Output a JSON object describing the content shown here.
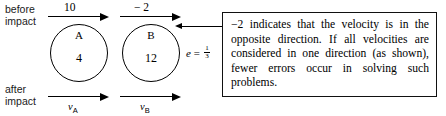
{
  "diagram": {
    "labels": {
      "before_line1": "before",
      "before_line2": "impact",
      "after_line1": "after",
      "after_line2": "impact"
    },
    "bodies": [
      {
        "name": "A",
        "mass": "4"
      },
      {
        "name": "B",
        "mass": "12"
      }
    ],
    "velocities_before": [
      {
        "value": "10",
        "body": "A"
      },
      {
        "value": "− 2",
        "body": "B"
      }
    ],
    "velocities_after": [
      {
        "symbol": "v",
        "subscript": "A"
      },
      {
        "symbol": "v",
        "subscript": "B"
      }
    ],
    "restitution": {
      "symbol": "e",
      "equals": "=",
      "numerator": "1",
      "denominator": "3"
    },
    "callout": {
      "text": "−2 indicates that the velocity is in the opposite direction. If all velocities are considered in one direction (as shown), fewer errors occur in solving such problems."
    },
    "colors": {
      "ink": "#000000",
      "background": "#ffffff"
    }
  }
}
